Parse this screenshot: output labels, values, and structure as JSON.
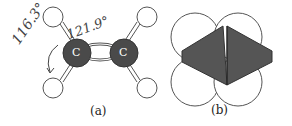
{
  "figure_a": {
    "label": "(a)",
    "atom_label": "C",
    "angle_1": "116.3°",
    "angle_2": "121.9°"
  },
  "figure_b": {
    "label": "(b)"
  },
  "colors": {
    "carbon": "#4a4a4a",
    "overlap": "#555555",
    "line": "#333333",
    "handwriting": "#444444"
  }
}
